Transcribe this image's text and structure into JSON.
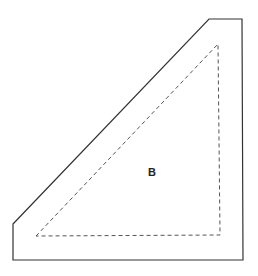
{
  "diagram": {
    "region_label": "B",
    "outer_shape": {
      "points": "13,224 209,19 242,19 243,260 13,260",
      "stroke": "#333333",
      "style": "solid"
    },
    "inner_shape": {
      "points": "36,236 218,44 220,235",
      "stroke": "#555555",
      "style": "dashed"
    }
  }
}
